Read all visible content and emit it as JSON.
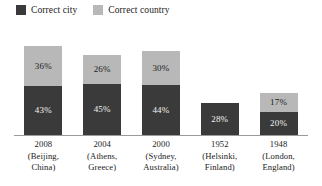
{
  "chart_data": {
    "type": "bar",
    "subtype": "stacked-vertical",
    "title": "",
    "xlabel": "",
    "ylabel": "",
    "ylim": [
      0,
      100
    ],
    "grid": false,
    "legend_position": "top-left",
    "value_suffix": "%",
    "categories": [
      "2008 (Beijing, China)",
      "2004 (Athens, Greece)",
      "2000 (Sydney, Australia)",
      "1952 (Helsinki, Finland)",
      "1948 (London, England)"
    ],
    "series": [
      {
        "name": "Correct city",
        "color": "#3a3a3a",
        "values": [
          43,
          45,
          44,
          28,
          20
        ]
      },
      {
        "name": "Correct country",
        "color": "#b8b8b8",
        "values": [
          36,
          26,
          30,
          0,
          17
        ]
      }
    ]
  },
  "legend": {
    "entries": [
      {
        "label": "Correct city",
        "color": "#3a3a3a",
        "swatch": "legend-swatch-city"
      },
      {
        "label": "Correct country",
        "color": "#b8b8b8",
        "swatch": "legend-swatch-country"
      }
    ]
  },
  "bars": [
    {
      "year": "2008",
      "city_value": "43%",
      "country_value": "36%",
      "label_lines": [
        "2008",
        "(Beijing,",
        "China)"
      ]
    },
    {
      "year": "2004",
      "city_value": "45%",
      "country_value": "26%",
      "label_lines": [
        "2004",
        "(Athens,",
        "Greece)"
      ]
    },
    {
      "year": "2000",
      "city_value": "44%",
      "country_value": "30%",
      "label_lines": [
        "2000",
        "(Sydney,",
        "Australia)"
      ]
    },
    {
      "year": "1952",
      "city_value": "28%",
      "country_value": "",
      "label_lines": [
        "1952",
        "(Helsinki,",
        "Finland)"
      ]
    },
    {
      "year": "1948",
      "city_value": "20%",
      "country_value": "17%",
      "label_lines": [
        "1948",
        "(London,",
        "England)"
      ]
    }
  ],
  "colors": {
    "city": "#3a3a3a",
    "country": "#b8b8b8",
    "axis": "#9a9a9a",
    "background": "#ffffff"
  }
}
